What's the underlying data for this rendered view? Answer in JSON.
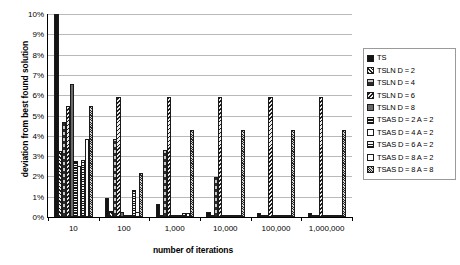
{
  "chart_data": {
    "type": "bar",
    "title": "",
    "xlabel": "number of iterations",
    "ylabel": "deviation from best found solution",
    "categories": [
      "10",
      "100",
      "1,000",
      "10,000",
      "100,000",
      "1,000,000"
    ],
    "ylim": [
      0,
      10
    ],
    "yticks": [
      "0%",
      "1%",
      "2%",
      "3%",
      "4%",
      "5%",
      "6%",
      "7%",
      "8%",
      "9%",
      "10%"
    ],
    "ytick_values": [
      0,
      1,
      2,
      3,
      4,
      5,
      6,
      7,
      8,
      9,
      10
    ],
    "yunit": "%",
    "grid": true,
    "legend_position": "right",
    "series": [
      {
        "name": "TS",
        "pattern": "p-solid",
        "values": [
          10.0,
          0.95,
          0.65,
          0.25,
          0.2,
          0.22
        ]
      },
      {
        "name": "TSLN D = 2",
        "pattern": "p-diag1",
        "values": [
          3.25,
          0.3,
          0.1,
          0.08,
          0.05,
          0.07
        ]
      },
      {
        "name": "TSLN D = 4",
        "pattern": "p-grey50",
        "values": [
          4.7,
          3.85,
          3.3,
          1.95,
          0.05,
          0.05
        ]
      },
      {
        "name": "TSLN D = 6",
        "pattern": "p-diag2",
        "values": [
          5.45,
          5.9,
          5.9,
          5.9,
          5.9,
          5.9
        ]
      },
      {
        "name": "TSLN D = 8",
        "pattern": "p-grey75",
        "values": [
          6.55,
          0.25,
          0.1,
          0.1,
          0.03,
          0.03
        ]
      },
      {
        "name": "TSAS D = 2 A = 2",
        "pattern": "p-horiz",
        "values": [
          2.75,
          0.12,
          0.1,
          0.1,
          0.02,
          0.02
        ]
      },
      {
        "name": "TSAS D = 4 A = 2",
        "pattern": "p-white",
        "values": [
          2.5,
          0.1,
          0.08,
          0.06,
          0.02,
          0.02
        ]
      },
      {
        "name": "TSAS D = 6 A = 2",
        "pattern": "p-crosshatch",
        "values": [
          2.8,
          1.35,
          0.2,
          0.1,
          0.03,
          0.03
        ]
      },
      {
        "name": "TSAS D = 8 A = 2",
        "pattern": "p-white2",
        "values": [
          3.85,
          0.25,
          0.2,
          0.12,
          0.02,
          0.02
        ]
      },
      {
        "name": "TSAS D = 8 A = 8",
        "pattern": "p-grey40",
        "values": [
          5.45,
          2.15,
          4.3,
          4.3,
          4.3,
          4.3
        ]
      }
    ]
  },
  "axis": {
    "x_title": "number of iterations",
    "y_title": "deviation from best found solution"
  }
}
